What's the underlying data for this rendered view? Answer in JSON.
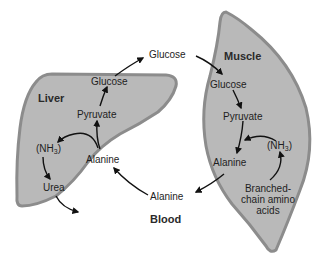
{
  "colors": {
    "organ_fill": "#b9b9b9",
    "organ_edge": "#8e8e8e",
    "arrow": "#111111",
    "text": "#1e1e1e",
    "background": "#ffffff"
  },
  "organs": {
    "liver": {
      "label": "Liver"
    },
    "muscle": {
      "label": "Muscle"
    },
    "blood": {
      "label": "Blood"
    }
  },
  "nodes": {
    "blood_glucose": "Glucose",
    "liver_glucose": "Glucose",
    "liver_pyruvate": "Pyruvate",
    "liver_nh3_prefix": "(NH",
    "liver_nh3_sub": "3",
    "liver_nh3_suffix": ")",
    "liver_alanine": "Alanine",
    "liver_urea": "Urea",
    "blood_alanine": "Alanine",
    "muscle_glucose": "Glucose",
    "muscle_pyruvate": "Pyruvate",
    "muscle_alanine": "Alanine",
    "muscle_nh3_prefix": "(NH",
    "muscle_nh3_sub": "3",
    "muscle_nh3_suffix": ")",
    "muscle_bcaa": "Branched-\nchain amino\nacids"
  },
  "edges": [
    {
      "from": "Liver Glucose",
      "to": "Blood Glucose"
    },
    {
      "from": "Blood Glucose",
      "to": "Muscle Glucose"
    },
    {
      "from": "Muscle Glucose",
      "to": "Muscle Pyruvate"
    },
    {
      "from": "Muscle Pyruvate",
      "to": "Muscle Alanine"
    },
    {
      "from": "Muscle (NH3)",
      "to": "Muscle Alanine"
    },
    {
      "from": "Branched-chain amino acids",
      "to": "Muscle (NH3)"
    },
    {
      "from": "Muscle Alanine",
      "to": "Blood Alanine"
    },
    {
      "from": "Blood Alanine",
      "to": "Liver Alanine"
    },
    {
      "from": "Liver Alanine",
      "to": "Liver Pyruvate"
    },
    {
      "from": "Liver Alanine",
      "to": "Liver (NH3)"
    },
    {
      "from": "Liver Pyruvate",
      "to": "Liver Glucose"
    },
    {
      "from": "Liver (NH3)",
      "to": "Urea"
    },
    {
      "from": "Urea",
      "to": "out"
    }
  ]
}
